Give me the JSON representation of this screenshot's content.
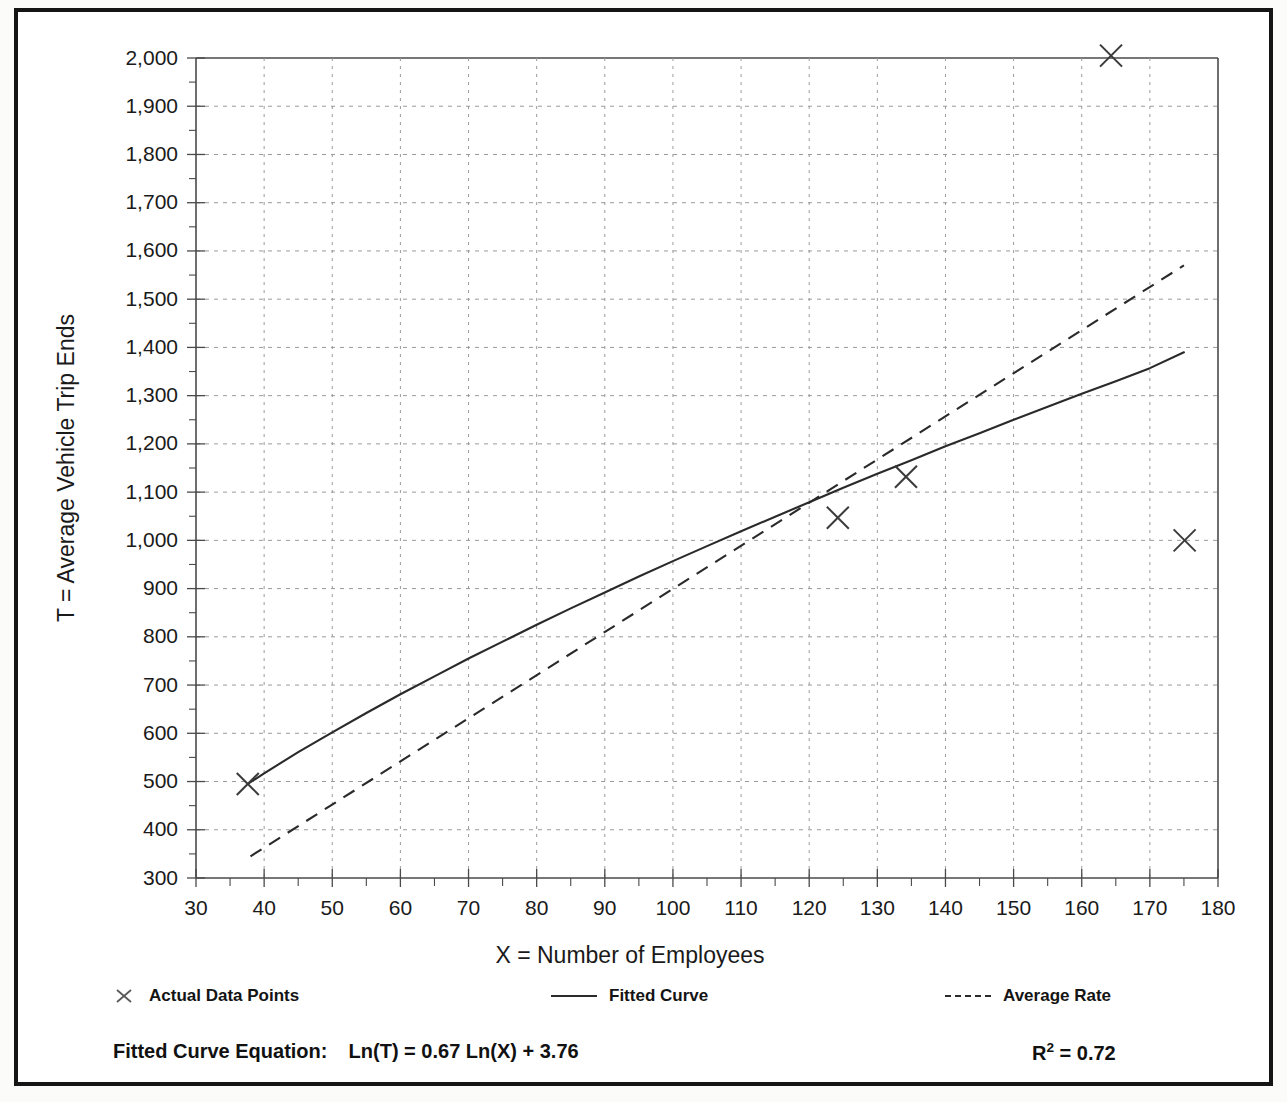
{
  "chart_data": {
    "type": "scatter",
    "title": "",
    "xlabel": "X = Number of Employees",
    "ylabel": "T = Average Vehicle Trip Ends",
    "xlim": [
      30,
      180
    ],
    "ylim": [
      300,
      2000
    ],
    "x_ticks": [
      30,
      40,
      50,
      60,
      70,
      80,
      90,
      100,
      110,
      120,
      130,
      140,
      150,
      160,
      170,
      180
    ],
    "x_tick_labels": [
      "30",
      "40",
      "50",
      "60",
      "70",
      "80",
      "90",
      "100",
      "110",
      "120",
      "130",
      "140",
      "150",
      "160",
      "170",
      "180"
    ],
    "x_minor_step": 5,
    "y_ticks": [
      300,
      400,
      500,
      600,
      700,
      800,
      900,
      1000,
      1100,
      1200,
      1300,
      1400,
      1500,
      1600,
      1700,
      1800,
      1900,
      2000
    ],
    "y_tick_labels": [
      "300",
      "400",
      "500",
      "600",
      "700",
      "800",
      "900",
      "1,000",
      "1,100",
      "1,200",
      "1,300",
      "1,400",
      "1,500",
      "1,600",
      "1,700",
      "1,800",
      "1,900",
      "2,000"
    ],
    "y_minor_step": 50,
    "grid": true,
    "legend_position": "below-axis",
    "series": [
      {
        "name": "Actual Data Points",
        "type": "scatter",
        "marker": "x",
        "points": [
          {
            "x": 37.6,
            "y": 495
          },
          {
            "x": 124.2,
            "y": 1047
          },
          {
            "x": 134.2,
            "y": 1132
          },
          {
            "x": 164.3,
            "y": 2005
          },
          {
            "x": 175.1,
            "y": 1000
          }
        ]
      },
      {
        "name": "Fitted Curve",
        "type": "line",
        "style": "solid",
        "equation": "Ln(T) = 0.67 Ln(X) + 3.76",
        "points": [
          {
            "x": 37.6,
            "y": 495
          },
          {
            "x": 40,
            "y": 517
          },
          {
            "x": 45,
            "y": 561
          },
          {
            "x": 50,
            "y": 602
          },
          {
            "x": 55,
            "y": 642
          },
          {
            "x": 60,
            "y": 681
          },
          {
            "x": 65,
            "y": 718
          },
          {
            "x": 70,
            "y": 755
          },
          {
            "x": 75,
            "y": 790
          },
          {
            "x": 80,
            "y": 825
          },
          {
            "x": 85,
            "y": 859
          },
          {
            "x": 90,
            "y": 892
          },
          {
            "x": 95,
            "y": 925
          },
          {
            "x": 100,
            "y": 957
          },
          {
            "x": 105,
            "y": 988
          },
          {
            "x": 110,
            "y": 1019
          },
          {
            "x": 115,
            "y": 1049
          },
          {
            "x": 120,
            "y": 1079
          },
          {
            "x": 125,
            "y": 1109
          },
          {
            "x": 130,
            "y": 1138
          },
          {
            "x": 135,
            "y": 1166
          },
          {
            "x": 140,
            "y": 1195
          },
          {
            "x": 145,
            "y": 1222
          },
          {
            "x": 150,
            "y": 1250
          },
          {
            "x": 155,
            "y": 1277
          },
          {
            "x": 160,
            "y": 1304
          },
          {
            "x": 165,
            "y": 1330
          },
          {
            "x": 170,
            "y": 1357
          },
          {
            "x": 175,
            "y": 1390
          }
        ]
      },
      {
        "name": "Average Rate",
        "type": "line",
        "style": "dashed",
        "points": [
          {
            "x": 38,
            "y": 345
          },
          {
            "x": 175,
            "y": 1570
          }
        ]
      }
    ]
  },
  "legend": {
    "items": [
      {
        "label": "Actual Data Points",
        "glyph": "x-marker"
      },
      {
        "label": "Fitted Curve",
        "glyph": "solid-line"
      },
      {
        "label": "Average Rate",
        "glyph": "dashed-line"
      }
    ]
  },
  "equation": {
    "label": "Fitted Curve Equation:",
    "formula": "Ln(T) = 0.67 Ln(X) + 3.76",
    "r_squared_symbol": "R",
    "r_squared_exponent": "2",
    "r_squared_value": "= 0.72"
  },
  "colors": {
    "line": "#2a2a2a",
    "grid": "#9a9a9a",
    "axis": "#4a4a4a",
    "frame": "#151515",
    "background": "#ffffff"
  }
}
